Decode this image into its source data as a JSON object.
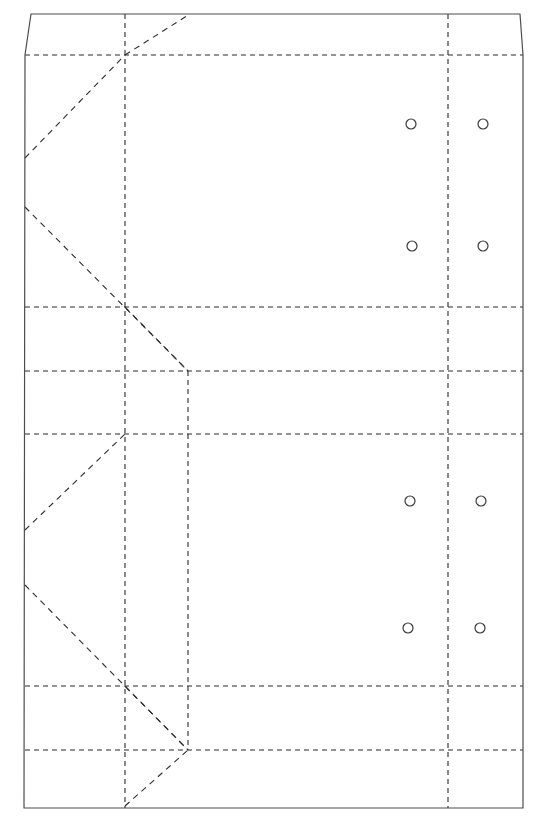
{
  "document": {
    "kind": "packaging-dieline",
    "title": "Carton Dieline / Fold Pattern",
    "canvas": {
      "width": 544,
      "height": 821,
      "background": "#ffffff"
    }
  },
  "styles": {
    "cut_color": "#4d4d4d",
    "cut_width": 1.2,
    "crease_color": "#2b2b2b",
    "crease_width": 1.1,
    "crease_dash": "5,4",
    "diagonal_dash": "6,5",
    "hole_stroke": "#3a3a3a",
    "hole_width": 1.2,
    "hole_fill": "none"
  },
  "outline": {
    "name": "cut-outline",
    "type": "polygon",
    "points": [
      [
        31,
        14
      ],
      [
        520,
        14
      ],
      [
        523,
        55
      ],
      [
        523,
        808
      ],
      [
        24,
        808
      ],
      [
        25,
        55
      ]
    ]
  },
  "creases": {
    "horizontal": [
      {
        "name": "crease-h-top",
        "y": 55,
        "x1": 25,
        "x2": 523
      },
      {
        "name": "crease-h-upper-mid",
        "y": 307,
        "x1": 25,
        "x2": 523
      },
      {
        "name": "crease-h-center",
        "y": 371,
        "x1": 25,
        "x2": 523
      },
      {
        "name": "crease-h-lower-mid",
        "y": 434,
        "x1": 25,
        "x2": 523
      },
      {
        "name": "crease-h-lower",
        "y": 686,
        "x1": 25,
        "x2": 523
      },
      {
        "name": "crease-h-bottom",
        "y": 750,
        "x1": 25,
        "x2": 523
      }
    ],
    "vertical": [
      {
        "name": "crease-v-left-panel",
        "x": 125,
        "y1": 14,
        "y2": 808
      },
      {
        "name": "crease-v-gusset",
        "x": 188,
        "y1": 371,
        "y2": 750
      },
      {
        "name": "crease-v-right-panel",
        "x": 448,
        "y1": 14,
        "y2": 808
      }
    ]
  },
  "diagonals": [
    {
      "name": "fold-diagonal-1",
      "x1": 25,
      "y1": 158,
      "x2": 125,
      "y2": 55
    },
    {
      "name": "fold-diagonal-2",
      "x1": 125,
      "y1": 55,
      "x2": 190,
      "y2": 14
    },
    {
      "name": "fold-diagonal-3",
      "x1": 25,
      "y1": 207,
      "x2": 188,
      "y2": 371
    },
    {
      "name": "fold-diagonal-4",
      "x1": 125,
      "y1": 307,
      "x2": 188,
      "y2": 371
    },
    {
      "name": "fold-diagonal-5",
      "x1": 25,
      "y1": 530,
      "x2": 125,
      "y2": 434
    },
    {
      "name": "fold-diagonal-6",
      "x1": 25,
      "y1": 585,
      "x2": 188,
      "y2": 750
    },
    {
      "name": "fold-diagonal-7",
      "x1": 125,
      "y1": 686,
      "x2": 188,
      "y2": 750
    },
    {
      "name": "fold-diagonal-8",
      "x1": 125,
      "y1": 806,
      "x2": 188,
      "y2": 750
    }
  ],
  "holes": {
    "radius": 5,
    "items": [
      {
        "name": "hole-top-left-a",
        "cx": 411,
        "cy": 124
      },
      {
        "name": "hole-top-right-a",
        "cx": 483,
        "cy": 124
      },
      {
        "name": "hole-top-left-b",
        "cx": 412,
        "cy": 246
      },
      {
        "name": "hole-top-right-b",
        "cx": 483,
        "cy": 246
      },
      {
        "name": "hole-bottom-left-a",
        "cx": 410,
        "cy": 501
      },
      {
        "name": "hole-bottom-right-a",
        "cx": 481,
        "cy": 501
      },
      {
        "name": "hole-bottom-left-b",
        "cx": 408,
        "cy": 628
      },
      {
        "name": "hole-bottom-right-b",
        "cx": 480,
        "cy": 628
      }
    ]
  }
}
